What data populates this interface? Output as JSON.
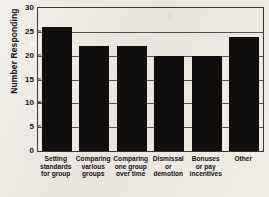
{
  "chart_data": {
    "type": "bar",
    "title": "",
    "xlabel": "",
    "ylabel": "Number Responding",
    "ylim": [
      0,
      30
    ],
    "yticks": [
      0,
      5,
      10,
      15,
      20,
      25,
      30
    ],
    "grid": true,
    "legend": false,
    "categories": [
      "Setting standards for group",
      "Comparing various groups",
      "Comparing one group over time",
      "Dismissal or demotion",
      "Bonuses or pay incentives",
      "Other"
    ],
    "category_lines": [
      [
        "Setting",
        "standards",
        "for group"
      ],
      [
        "Comparing",
        "various",
        "groups"
      ],
      [
        "Comparing",
        "one group",
        "over time"
      ],
      [
        "Dismissal",
        "or",
        "demotion"
      ],
      [
        "Bonuses",
        "or pay",
        "incentives"
      ],
      [
        "Other"
      ]
    ],
    "values": [
      26,
      22,
      22,
      20,
      20,
      24
    ],
    "bar_color": "#100f0d",
    "axis_color": "#3a3732",
    "grid_color": "#58544d",
    "background_color": "#edeae4"
  }
}
